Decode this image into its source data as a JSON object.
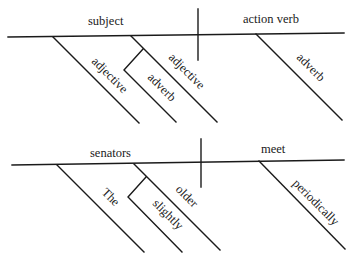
{
  "diagrams": [
    {
      "name": "template",
      "subject": "subject",
      "verb": "action verb",
      "subject_modifiers": [
        "adjective",
        "adjective"
      ],
      "adjective_modifier": "adverb",
      "verb_modifier": "adverb"
    },
    {
      "name": "example",
      "subject": "senators",
      "verb": "meet",
      "subject_modifiers": [
        "The",
        "older"
      ],
      "adjective_modifier": "slightly",
      "verb_modifier": "periodically"
    }
  ]
}
